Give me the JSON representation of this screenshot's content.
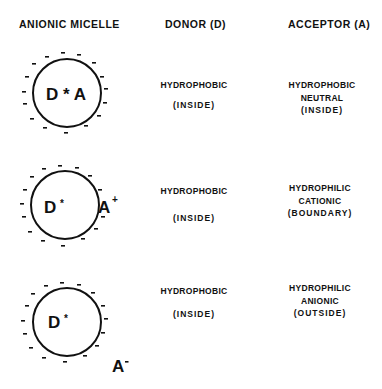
{
  "headers": {
    "micelle": "ANIONIC  MICELLE",
    "donor": "DONOR (D)",
    "acceptor": "ACCEPTOR (A)"
  },
  "rows": [
    {
      "micelle_label": "D * A",
      "donor": {
        "line1": "HYDROPHOBIC",
        "line2": "(INSIDE)"
      },
      "acceptor": {
        "line1": "HYDROPHOBIC",
        "line2": "NEUTRAL",
        "line3": "(INSIDE)"
      }
    },
    {
      "micelle_label_d": "D",
      "star": "*",
      "acceptor_symbol": "A",
      "acceptor_charge": "+",
      "donor": {
        "line1": "HYDROPHOBIC",
        "line2": "(INSIDE)"
      },
      "acceptor": {
        "line1": "HYDROPHILIC",
        "line2": "CATIONIC",
        "line3": "(BOUNDARY)"
      }
    },
    {
      "micelle_label_d": "D",
      "star": "*",
      "acceptor_symbol": "A",
      "acceptor_charge": "-",
      "donor": {
        "line1": "HYDROPHOBIC",
        "line2": "(INSIDE)"
      },
      "acceptor": {
        "line1": "HYDROPHILIC",
        "line2": "ANIONIC",
        "line3": "(OUTSIDE)"
      }
    }
  ],
  "surface_charge": "-",
  "colors": {
    "ink": "#111111",
    "background": "#ffffff"
  }
}
